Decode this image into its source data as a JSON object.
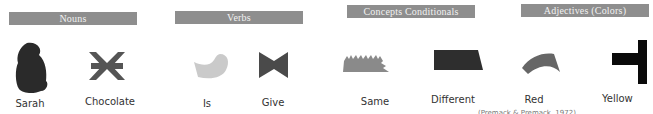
{
  "categories": [
    {
      "header": "Nouns",
      "items": [
        {
          "label": "Sarah",
          "symbol": "blob-shape-icon",
          "color": "#2a2a2a"
        },
        {
          "label": "Chocolate",
          "symbol": "asterisk-shape-icon",
          "color": "#555555"
        }
      ]
    },
    {
      "header": "Verbs",
      "items": [
        {
          "label": "Is",
          "symbol": "curved-shape-icon",
          "color": "#c8c8c8"
        },
        {
          "label": "Give",
          "symbol": "bowtie-shape-icon",
          "color": "#4a4a4a"
        }
      ]
    },
    {
      "header": "Concepts Conditionals",
      "items": [
        {
          "label": "Same",
          "symbol": "serrated-shape-icon",
          "color": "#8a8a8a"
        },
        {
          "label": "Different",
          "symbol": "trapezoid-shape-icon",
          "color": "#2e2e2e"
        }
      ]
    },
    {
      "header": "Adjectives (Colors)",
      "items": [
        {
          "label": "Red",
          "symbol": "arc-shape-icon",
          "color": "#666666"
        },
        {
          "label": "Yellow",
          "symbol": "t-shape-icon",
          "color": "#0a0a0a"
        }
      ]
    }
  ],
  "citation": "(Premack & Premack, 1972)"
}
